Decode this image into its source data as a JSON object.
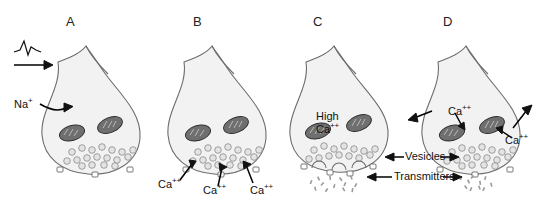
{
  "figure": {
    "background_color": "#ffffff",
    "outline_color": "#6d6d6d",
    "text_color": "#111111",
    "vesicle_color": "#e3e3e3",
    "mitochondria_color": "#6f6f6f",
    "transmitter_color": "#9a9a9a"
  },
  "panels": [
    {
      "letter": "A",
      "caption_labels": [
        "Na+"
      ],
      "stage": "action potential arrives, Na+ influx"
    },
    {
      "letter": "B",
      "caption_labels": [
        "Ca++",
        "Ca++",
        "Ca++"
      ],
      "stage": "calcium channels open, Ca++ influx"
    },
    {
      "letter": "C",
      "caption_labels": [
        "High",
        "Ca++"
      ],
      "stage": "high internal calcium, vesicle fusion and transmitter release"
    },
    {
      "letter": "D",
      "caption_labels": [
        "Ca++",
        "Ca++"
      ],
      "stage": "calcium sequestered by mitochondria and extruded"
    }
  ],
  "labels": {
    "sodium": "Na",
    "sodium_charge": "+",
    "calcium": "Ca",
    "calcium_charge": "++",
    "high": "High",
    "vesicles": "Vesicles",
    "transmitters": "Transmitters"
  },
  "panel_letters": {
    "a": "A",
    "b": "B",
    "c": "C",
    "d": "D"
  },
  "icons": {
    "action_potential": "spike-waveform",
    "propagation": "right-arrow"
  }
}
